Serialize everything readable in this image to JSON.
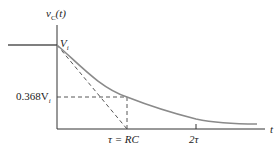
{
  "diagram": {
    "y_axis_label": "v",
    "y_axis_sub": "C",
    "y_axis_arg": "(t)",
    "x_axis_label": "t",
    "initial_label": "V",
    "initial_sub": "i",
    "level_label": "0.368V",
    "level_sub": "i",
    "tau_label": "τ = RC",
    "two_tau_label": "2τ",
    "colors": {
      "axis": "#333333",
      "curve": "#8a8a8a",
      "dashed": "#444444"
    }
  }
}
